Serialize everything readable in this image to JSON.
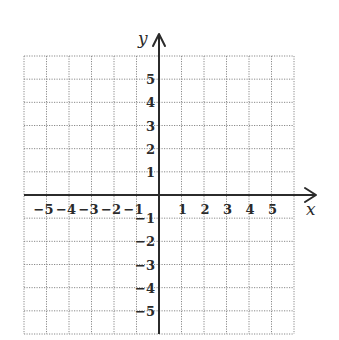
{
  "diagram": {
    "type": "coordinate-plane",
    "background": "#ffffff",
    "grid_color": "#8a8a8a",
    "axis_color": "#2b2b2b",
    "x_axis": {
      "label": "x",
      "min": -6,
      "max": 6,
      "tick_labels": [
        "−5",
        "−4",
        "−3",
        "−2",
        "−1",
        "1",
        "2",
        "3",
        "4",
        "5"
      ],
      "tick_values": [
        -5,
        -4,
        -3,
        -2,
        -1,
        1,
        2,
        3,
        4,
        5
      ]
    },
    "y_axis": {
      "label": "y",
      "min": -6,
      "max": 6,
      "tick_labels": [
        "5",
        "4",
        "3",
        "2",
        "1",
        "−1",
        "−2",
        "−3",
        "−4",
        "−5"
      ],
      "tick_values": [
        5,
        4,
        3,
        2,
        1,
        -1,
        -2,
        -3,
        -4,
        -5
      ]
    },
    "grid": {
      "style": "dotted",
      "cells_x": 12,
      "cells_y": 12
    }
  }
}
